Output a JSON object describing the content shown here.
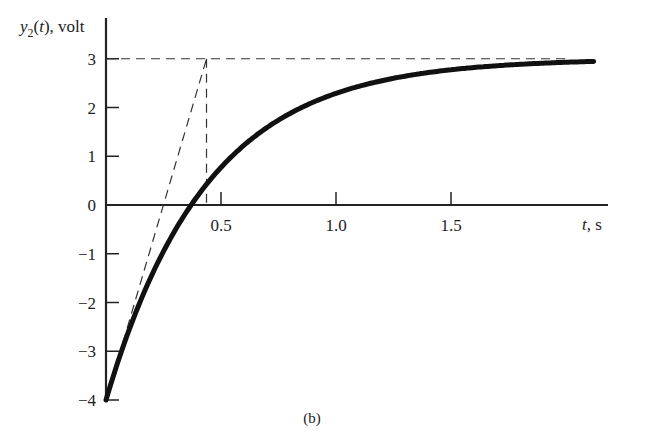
{
  "chart_data": {
    "type": "line",
    "title": "",
    "subplot_label": "(b)",
    "xlabel": "t, s",
    "ylabel": "y2(t), volt",
    "xlim": [
      0,
      2.1
    ],
    "ylim": [
      -4,
      3.6
    ],
    "grid": false,
    "legend": null,
    "x_ticks": [
      0.5,
      1.0,
      1.5
    ],
    "x_tick_labels": [
      "0.5",
      "1.0",
      "1.5"
    ],
    "y_ticks": [
      -4,
      -3,
      -2,
      -1,
      0,
      1,
      2,
      3
    ],
    "y_tick_labels": [
      "−4",
      "−3",
      "−2",
      "−1",
      "0",
      "1",
      "2",
      "3"
    ],
    "series": [
      {
        "name": "y2(t) = 3 - 7e^(-t/τ)",
        "style": "solid-thick",
        "tau": 0.437,
        "final_value": 3,
        "initial_value": -4,
        "x": [
          0,
          0.1,
          0.2,
          0.3,
          0.37,
          0.5,
          0.75,
          1.0,
          1.25,
          1.5,
          1.75,
          2.0
        ],
        "y": [
          -4.0,
          -2.57,
          -1.44,
          -0.53,
          0.0,
          0.87,
          1.75,
          2.29,
          2.59,
          2.77,
          2.87,
          2.93
        ]
      }
    ],
    "annotations": [
      {
        "type": "dashed-line",
        "name": "final-value-asymptote",
        "from": [
          0,
          3
        ],
        "to": [
          2.0,
          3
        ]
      },
      {
        "type": "dashed-line",
        "name": "initial-tangent",
        "from": [
          0,
          -4
        ],
        "to": [
          0.437,
          3
        ]
      },
      {
        "type": "dashed-line",
        "name": "time-constant-marker",
        "from": [
          0.437,
          3
        ],
        "to": [
          0.437,
          0
        ]
      }
    ]
  }
}
